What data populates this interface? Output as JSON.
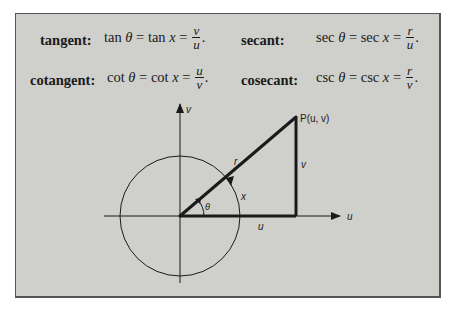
{
  "definitions": [
    {
      "name": "tangent:",
      "func1": "tan",
      "var1": "θ",
      "eq": "=",
      "func2": "tan",
      "var2": "x",
      "numerator": "v",
      "denominator": "u",
      "end": "."
    },
    {
      "name": "secant:",
      "func1": "sec",
      "var1": "θ",
      "eq": "=",
      "func2": "sec",
      "var2": "x",
      "numerator": "r",
      "denominator": "u",
      "end": "."
    },
    {
      "name": "cotangent:",
      "func1": "cot",
      "var1": "θ",
      "eq": "=",
      "func2": "cot",
      "var2": "x",
      "numerator": "u",
      "denominator": "v",
      "end": "."
    },
    {
      "name": "cosecant:",
      "func1": "csc",
      "var1": "θ",
      "eq": "=",
      "func2": "csc",
      "var2": "x",
      "numerator": "r",
      "denominator": "v",
      "end": "."
    }
  ],
  "diagram": {
    "point_label": "P(u, v)",
    "axis_u_label": "u",
    "axis_v_label": "v",
    "hypotenuse_label": "r",
    "vertical_side_label": "v",
    "horizontal_side_label": "u",
    "arc_label": "x",
    "angle_label": "θ"
  },
  "colors": {
    "panel_background": "#cfcfcc",
    "ink": "#1a1a1a",
    "border": "#555555"
  }
}
